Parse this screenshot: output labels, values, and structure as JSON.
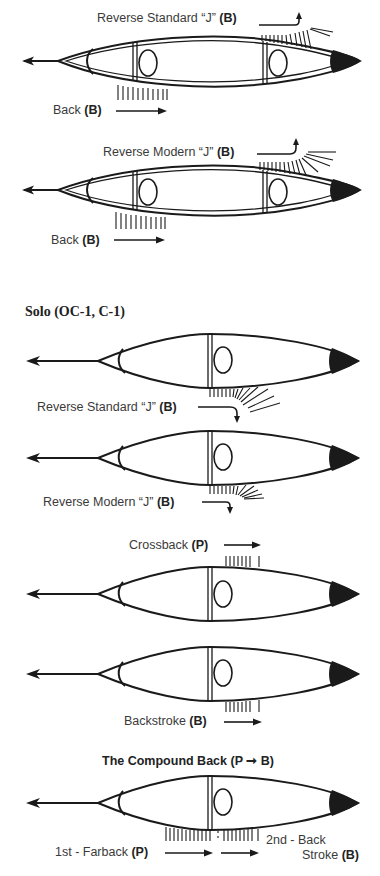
{
  "tandem": {
    "diagrams": [
      {
        "id": "tandem-1",
        "strokes": [
          {
            "name": "Reverse Standard “J”",
            "paddler": "(B)",
            "position": "stern-top"
          },
          {
            "name": "Back",
            "paddler": "(B)",
            "position": "bow-bottom"
          }
        ]
      },
      {
        "id": "tandem-2",
        "strokes": [
          {
            "name": "Reverse Modern “J”",
            "paddler": "(B)",
            "position": "stern-top"
          },
          {
            "name": "Back",
            "paddler": "(B)",
            "position": "bow-bottom"
          }
        ]
      }
    ]
  },
  "solo": {
    "title": "Solo (OC-1, C-1)",
    "diagrams": [
      {
        "id": "solo-1",
        "stroke": {
          "name": "Reverse Standard “J”",
          "paddler": "(B)"
        }
      },
      {
        "id": "solo-2",
        "stroke": {
          "name": "Reverse Modern “J”",
          "paddler": "(B)"
        }
      },
      {
        "id": "solo-3",
        "stroke": {
          "name": "Crossback",
          "paddler": "(P)"
        }
      },
      {
        "id": "solo-4",
        "stroke": {
          "name": "Backstroke",
          "paddler": "(B)"
        }
      },
      {
        "id": "solo-5",
        "title": "The Compound Back (P → B)",
        "title_main": "The Compound Back",
        "title_paren": "(P ➞ B)",
        "strokes": [
          {
            "name": "1st - Farback",
            "paddler": "(P)"
          },
          {
            "name": "2nd - Back",
            "name_line2": "Stroke",
            "paddler": "(B)"
          }
        ]
      }
    ]
  },
  "legend_hint": {
    "B": "B",
    "P": "P"
  },
  "colors": {
    "line": "#1a1a1a",
    "text": "#3a3a3a",
    "background": "#ffffff"
  }
}
